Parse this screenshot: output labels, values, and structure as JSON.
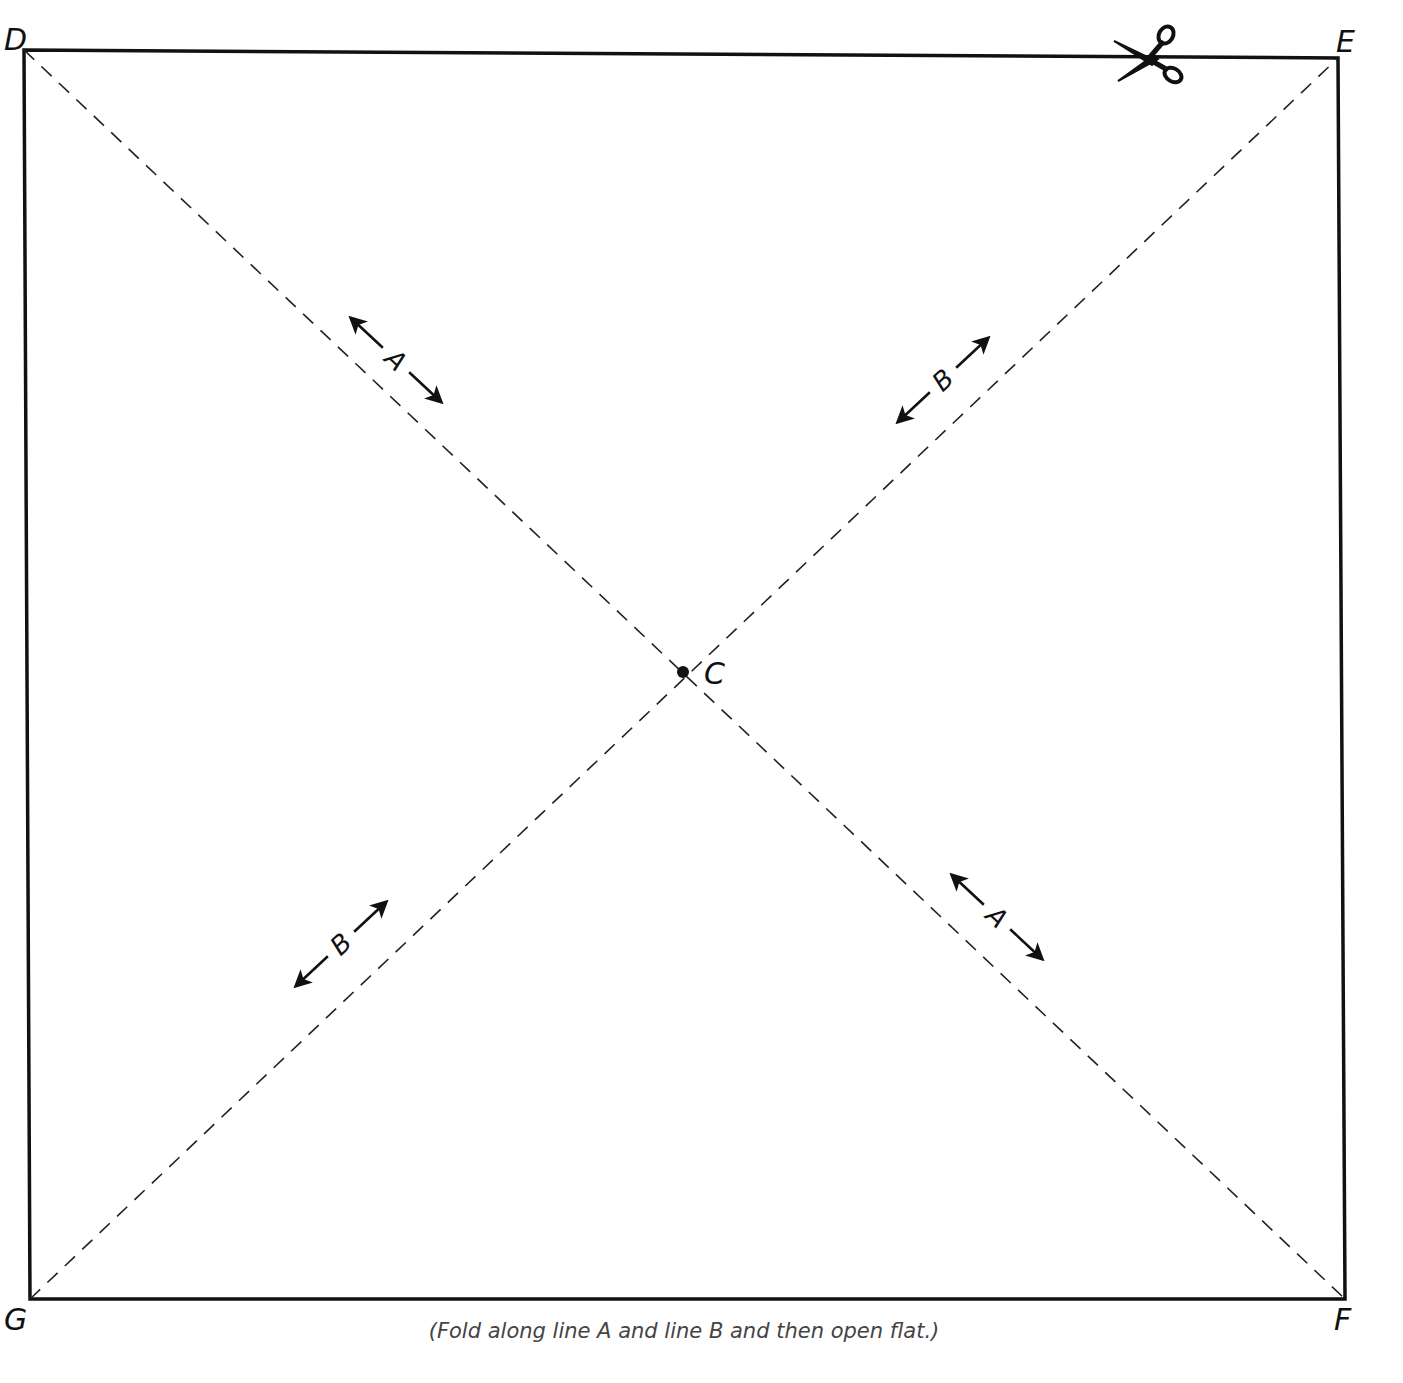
{
  "diagram": {
    "square": {
      "corners": {
        "D": {
          "label": "D",
          "x": 24,
          "y": 50
        },
        "E": {
          "label": "E",
          "x": 1338,
          "y": 58
        },
        "F": {
          "label": "F",
          "x": 1345,
          "y": 1299
        },
        "G": {
          "label": "G",
          "x": 30,
          "y": 1299
        }
      },
      "stroke_color": "#111111"
    },
    "center": {
      "label": "C",
      "x": 683,
      "y": 672
    },
    "fold_lines": [
      {
        "name": "A",
        "from": "D",
        "to": "F",
        "style": "dashed"
      },
      {
        "name": "B",
        "from": "G",
        "to": "E",
        "style": "dashed"
      }
    ],
    "arrow_markers": [
      {
        "label": "A",
        "line": "A",
        "x": 396,
        "y": 360,
        "angle": 45
      },
      {
        "label": "B",
        "line": "B",
        "x": 943,
        "y": 380,
        "angle": -45
      },
      {
        "label": "B",
        "line": "B",
        "x": 341,
        "y": 944,
        "angle": -45
      },
      {
        "label": "A",
        "line": "A",
        "x": 997,
        "y": 917,
        "angle": 45
      }
    ],
    "scissors": {
      "icon": "scissors-icon",
      "x": 1150,
      "y": 57
    },
    "caption": "(Fold along line A and line B and then open flat.)"
  }
}
